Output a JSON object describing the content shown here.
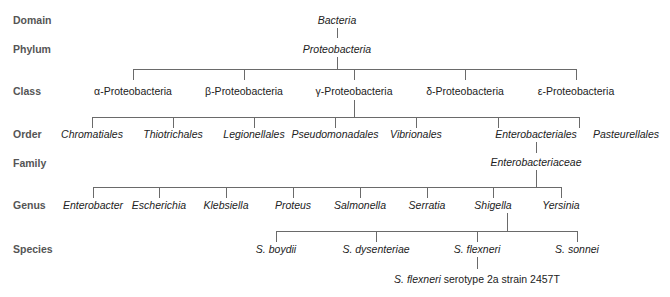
{
  "ranks": {
    "domain": "Domain",
    "phylum": "Phylum",
    "class": "Class",
    "order": "Order",
    "family": "Family",
    "genus": "Genus",
    "species": "Species"
  },
  "domain": "Bacteria",
  "phylum": "Proteobacteria",
  "classes": [
    "α-Proteobacteria",
    "β-Proteobacteria",
    "γ-Proteobacteria",
    "δ-Proteobacteria",
    "ε-Proteobacteria"
  ],
  "orders": [
    "Chromatiales",
    "Thiotrichales",
    "Legionellales",
    "Pseudomonadales",
    "Vibrionales",
    "Enterobacteriales",
    "Pasteurellales"
  ],
  "family": "Enterobacteriaceae",
  "genera": [
    "Enterobacter",
    "Escherichia",
    "Klebsiella",
    "Proteus",
    "Salmonella",
    "Serratia",
    "Shigella",
    "Yersinia"
  ],
  "species": [
    "S. boydii",
    "S. dysenteriae",
    "S. flexneri",
    "S. sonnei"
  ],
  "strain": {
    "species_part": "S. flexneri",
    "rest": " serotype 2a strain 2457T"
  }
}
